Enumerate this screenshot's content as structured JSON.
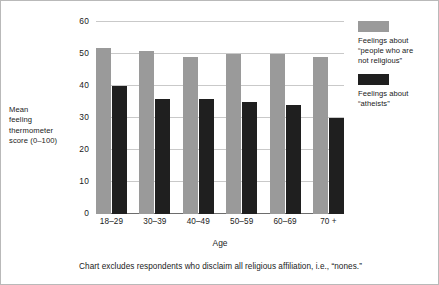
{
  "chart_data": {
    "type": "bar",
    "title": "",
    "categories": [
      "18–29",
      "30–39",
      "40–49",
      "50–59",
      "60–69",
      "70 +"
    ],
    "series": [
      {
        "name": "Feelings about “people who are not religious”",
        "color": "#9a9a9a",
        "values": [
          52,
          51,
          49,
          50,
          50,
          49
        ]
      },
      {
        "name": "Feelings about “atheists”",
        "color": "#1f1f1f",
        "values": [
          40,
          36,
          36,
          35,
          34,
          30
        ]
      }
    ],
    "xlabel": "Age",
    "ylabel": "Mean feeling thermometer score (0–100)",
    "ylim": [
      0,
      60
    ],
    "yticks": [
      0,
      10,
      20,
      30,
      40,
      50,
      60
    ],
    "grid": true,
    "legend_position": "right"
  },
  "axis": {
    "ylabel_lines": [
      "Mean",
      "feeling",
      "thermometer",
      "score (0–100)"
    ],
    "xlabel": "Age"
  },
  "legend": {
    "entries": [
      {
        "swatch": "#9a9a9a",
        "lines": [
          "Feelings about",
          "“people who are",
          "not religious”"
        ]
      },
      {
        "swatch": "#1f1f1f",
        "lines": [
          "Feelings about",
          "“atheists”"
        ]
      }
    ]
  },
  "footnote": "Chart excludes respondents who disclaim all religious affiliation, i.e., “nones.”"
}
